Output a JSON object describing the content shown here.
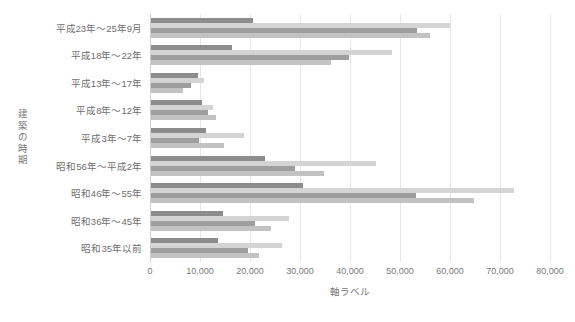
{
  "chart_data": {
    "type": "bar",
    "orientation": "horizontal",
    "title": "",
    "xlabel": "軸ラベル",
    "ylabel": "建築の時期",
    "xlim": [
      0,
      80000
    ],
    "xticks": [
      0,
      10000,
      20000,
      30000,
      40000,
      50000,
      60000,
      70000,
      80000
    ],
    "xtick_labels": [
      "0",
      "10,000",
      "20,000",
      "30,000",
      "40,000",
      "50,000",
      "60,000",
      "70,000",
      "80,000"
    ],
    "grid": true,
    "legend": "none",
    "categories": [
      "平成23年～25年9月",
      "平成18年～22年",
      "平成13年～17年",
      "平成8年～12年",
      "平成3年～7年",
      "昭和56年～平成2年",
      "昭和46年～55年",
      "昭和36年～45年",
      "昭和35年以前"
    ],
    "series": [
      {
        "name": "series-1",
        "color": "#8c8c8c",
        "values": [
          20400,
          16200,
          9400,
          10200,
          11000,
          22800,
          30400,
          14400,
          13400
        ]
      },
      {
        "name": "series-2",
        "color": "#d4d4d4",
        "values": [
          59800,
          48200,
          10600,
          12400,
          18600,
          45000,
          72600,
          27600,
          26200
        ]
      },
      {
        "name": "series-3",
        "color": "#9e9e9e",
        "values": [
          53200,
          39600,
          8000,
          11400,
          9600,
          28800,
          53000,
          20800,
          19400
        ]
      },
      {
        "name": "series-4",
        "color": "#c2c2c2",
        "values": [
          55800,
          36000,
          6400,
          13000,
          14600,
          34600,
          64600,
          24000,
          21600
        ]
      }
    ]
  },
  "axis": {
    "x_title": "軸ラベル",
    "y_title_chars": "建\n築\nの\n時\n期"
  },
  "colors": {
    "gridline": "#e6e6e6",
    "axis_line": "#d0d0d0",
    "tick_text": "#7a7a7a",
    "category_text": "#6f6f6f",
    "background": "#ffffff"
  }
}
